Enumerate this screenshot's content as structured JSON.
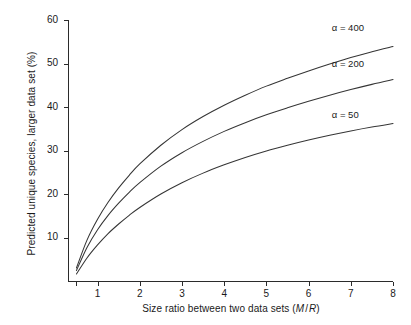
{
  "chart_data": {
    "type": "line",
    "title": "",
    "subtitle": "",
    "xlabel": "Size ratio between two data sets (M/R)",
    "xlabel_parts": {
      "plain": "Size ratio between two data sets (",
      "italic_m": "M",
      "slash": "/",
      "italic_r": "R",
      "close": ")"
    },
    "ylabel": "Predicted unique species, larger data set (%)",
    "xlim": [
      0.3,
      8
    ],
    "ylim": [
      0,
      60
    ],
    "xticks": [
      1,
      2,
      3,
      4,
      5,
      6,
      7,
      8
    ],
    "xtick_labels": [
      "1",
      "2",
      "3",
      "4",
      "5",
      "6",
      "7",
      "8"
    ],
    "yticks": [
      10,
      20,
      30,
      40,
      50,
      60
    ],
    "ytick_labels": [
      "10",
      "20",
      "30",
      "40",
      "50",
      "60"
    ],
    "grid": false,
    "legend_position": "inline-right-of-curve",
    "x": [
      0.5,
      0.75,
      1,
      1.25,
      1.5,
      1.75,
      2,
      2.5,
      3,
      3.5,
      4,
      4.5,
      5,
      5.5,
      6,
      6.5,
      7,
      7.5,
      8
    ],
    "series": [
      {
        "name": "alpha = 400",
        "label": "α = 400",
        "alpha": 400,
        "color": "#353535",
        "label_x": 6.55,
        "label_y": 58.0,
        "values": [
          3.0,
          9.4,
          14.2,
          18.1,
          21.4,
          24.3,
          26.9,
          31.2,
          34.8,
          37.8,
          40.4,
          42.7,
          44.8,
          46.6,
          48.3,
          49.9,
          51.4,
          52.7,
          53.9
        ]
      },
      {
        "name": "alpha = 200",
        "label": "α = 200",
        "alpha": 200,
        "color": "#353535",
        "label_x": 6.55,
        "label_y": 49.7,
        "values": [
          2.4,
          7.7,
          11.8,
          15.1,
          17.9,
          20.4,
          22.6,
          26.4,
          29.5,
          32.1,
          34.4,
          36.4,
          38.2,
          39.8,
          41.3,
          42.7,
          44.0,
          45.2,
          46.3
        ]
      },
      {
        "name": "alpha = 50",
        "label": "α = 50",
        "alpha": 50,
        "color": "#353535",
        "label_x": 6.55,
        "label_y": 38.0,
        "values": [
          1.6,
          5.3,
          8.3,
          10.9,
          13.1,
          15.1,
          16.9,
          20.0,
          22.6,
          24.8,
          26.7,
          28.4,
          29.9,
          31.2,
          32.4,
          33.5,
          34.5,
          35.4,
          36.2
        ]
      }
    ]
  },
  "colors": {
    "background": "#ffffff",
    "axis": "#2b2b2b",
    "curve": "#353535",
    "text": "#1a1a1a"
  }
}
